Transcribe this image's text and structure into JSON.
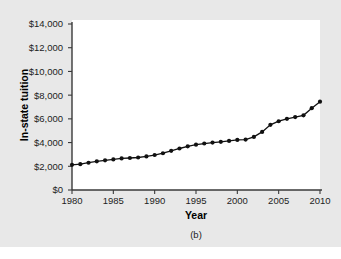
{
  "figure": {
    "caption": "(b)",
    "panel_background": "#e8e8e8",
    "plot_background": "#ffffff"
  },
  "chart_data": {
    "type": "line",
    "title": "",
    "subtitle": "",
    "xlabel": "Year",
    "ylabel": "In-state tuition",
    "caption": "(b)",
    "grid": false,
    "legend": false,
    "legend_position": "none",
    "marker": "filled-circle",
    "line_color": "#111111",
    "marker_color": "#111111",
    "xlim": [
      1980,
      2010
    ],
    "ylim": [
      0,
      14000
    ],
    "xticks": [
      1980,
      1985,
      1990,
      1995,
      2000,
      2005,
      2010
    ],
    "xtick_labels": [
      "1980",
      "1985",
      "1990",
      "1995",
      "2000",
      "2005",
      "2010"
    ],
    "yticks": [
      0,
      2000,
      4000,
      6000,
      8000,
      10000,
      12000,
      14000
    ],
    "ytick_labels": [
      "$0",
      "$2,000",
      "$4,000",
      "$6,000",
      "$8,000",
      "$10,000",
      "$12,000",
      "$14,000"
    ],
    "x": [
      1980,
      1981,
      1982,
      1983,
      1984,
      1985,
      1986,
      1987,
      1988,
      1989,
      1990,
      1991,
      1992,
      1993,
      1994,
      1995,
      1996,
      1997,
      1998,
      1999,
      2000,
      2001,
      2002,
      2003,
      2004,
      2005,
      2006,
      2007,
      2008,
      2009,
      2010
    ],
    "values": [
      2120,
      2180,
      2300,
      2420,
      2500,
      2580,
      2660,
      2700,
      2740,
      2830,
      2950,
      3100,
      3300,
      3500,
      3680,
      3820,
      3920,
      4000,
      4060,
      4140,
      4220,
      4250,
      4480,
      4900,
      5500,
      5800,
      6000,
      6150,
      6300,
      6900,
      7450
    ],
    "series": [
      {
        "name": "In-state tuition",
        "values": [
          2120,
          2180,
          2300,
          2420,
          2500,
          2580,
          2660,
          2700,
          2740,
          2830,
          2950,
          3100,
          3300,
          3500,
          3680,
          3820,
          3920,
          4000,
          4060,
          4140,
          4220,
          4250,
          4480,
          4900,
          5500,
          5800,
          6000,
          6150,
          6300,
          6900,
          7450
        ]
      }
    ]
  }
}
